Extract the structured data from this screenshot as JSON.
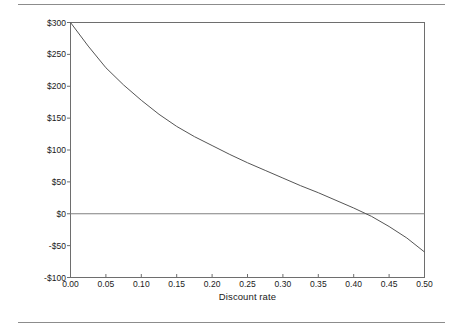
{
  "figure": {
    "has_top_rule": true,
    "has_bottom_rule": true,
    "rule_color": "#8c8c8c",
    "background": "#ffffff"
  },
  "axis": {
    "x_title": "Discount rate",
    "y_title": "Net benefits",
    "x_tick_labels": [
      "0.00",
      "0.05",
      "0.10",
      "0.15",
      "0.20",
      "0.25",
      "0.30",
      "0.35",
      "0.40",
      "0.45",
      "0.50"
    ],
    "y_tick_labels": [
      "$300",
      "$250",
      "$200",
      "$150",
      "$100",
      "$50",
      "$0",
      "-$50",
      "-$100"
    ]
  },
  "chart_data": {
    "type": "line",
    "title": "",
    "xlabel": "Discount rate",
    "ylabel": "Net benefits",
    "xlim": [
      0.0,
      0.5
    ],
    "ylim": [
      -100,
      300
    ],
    "xticks": [
      0.0,
      0.05,
      0.1,
      0.15,
      0.2,
      0.25,
      0.3,
      0.35,
      0.4,
      0.45,
      0.5
    ],
    "yticks": [
      -100,
      -50,
      0,
      50,
      100,
      150,
      200,
      250,
      300
    ],
    "grid": false,
    "legend": "none",
    "line_color": "#555555",
    "reference_lines": [
      {
        "name": "zero-net-benefits",
        "orientation": "horizontal",
        "y": 0,
        "color": "#808080"
      }
    ],
    "annotations": [
      {
        "name": "zero-crossing",
        "x": 0.343,
        "y": 0,
        "label": ""
      }
    ],
    "series": [
      {
        "name": "Net benefits",
        "x": [
          0.0,
          0.025,
          0.05,
          0.075,
          0.1,
          0.125,
          0.15,
          0.175,
          0.2,
          0.225,
          0.25,
          0.275,
          0.3,
          0.325,
          0.35,
          0.375,
          0.4,
          0.425,
          0.45,
          0.475,
          0.5
        ],
        "values": [
          300,
          263,
          229,
          202,
          178,
          156,
          137,
          121,
          107,
          93,
          80,
          68,
          56,
          44,
          33,
          21,
          9,
          -4,
          -20,
          -38,
          -60
        ]
      }
    ]
  }
}
